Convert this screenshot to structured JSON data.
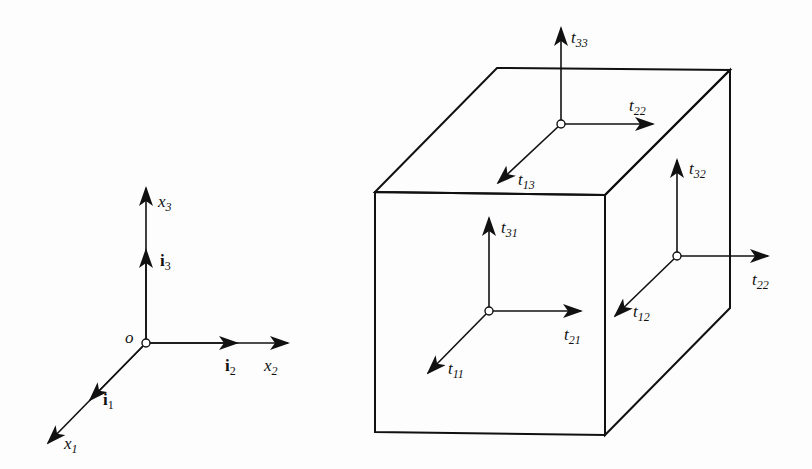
{
  "diagram": {
    "coordinate_system": {
      "origin_label": "o",
      "axes": [
        {
          "name": "x1",
          "base": "x",
          "sub": "1",
          "unit_vector": {
            "base": "i",
            "sub": "1"
          }
        },
        {
          "name": "x2",
          "base": "x",
          "sub": "2",
          "unit_vector": {
            "base": "i",
            "sub": "2"
          }
        },
        {
          "name": "x3",
          "base": "x",
          "sub": "3",
          "unit_vector": {
            "base": "i",
            "sub": "3"
          }
        }
      ]
    },
    "cube": {
      "top_face": {
        "normal": {
          "base": "t",
          "sub": "33"
        },
        "in_plane": [
          {
            "base": "t",
            "sub": "22"
          },
          {
            "base": "t",
            "sub": "13"
          }
        ]
      },
      "front_face": {
        "normal": {
          "base": "t",
          "sub": "11"
        },
        "in_plane": [
          {
            "base": "t",
            "sub": "31"
          },
          {
            "base": "t",
            "sub": "21"
          }
        ]
      },
      "right_face": {
        "normal": {
          "base": "t",
          "sub": "22"
        },
        "in_plane": [
          {
            "base": "t",
            "sub": "32"
          },
          {
            "base": "t",
            "sub": "12"
          }
        ]
      }
    },
    "colors": {
      "stroke": "#111111",
      "background": "#fdfdfd"
    }
  }
}
